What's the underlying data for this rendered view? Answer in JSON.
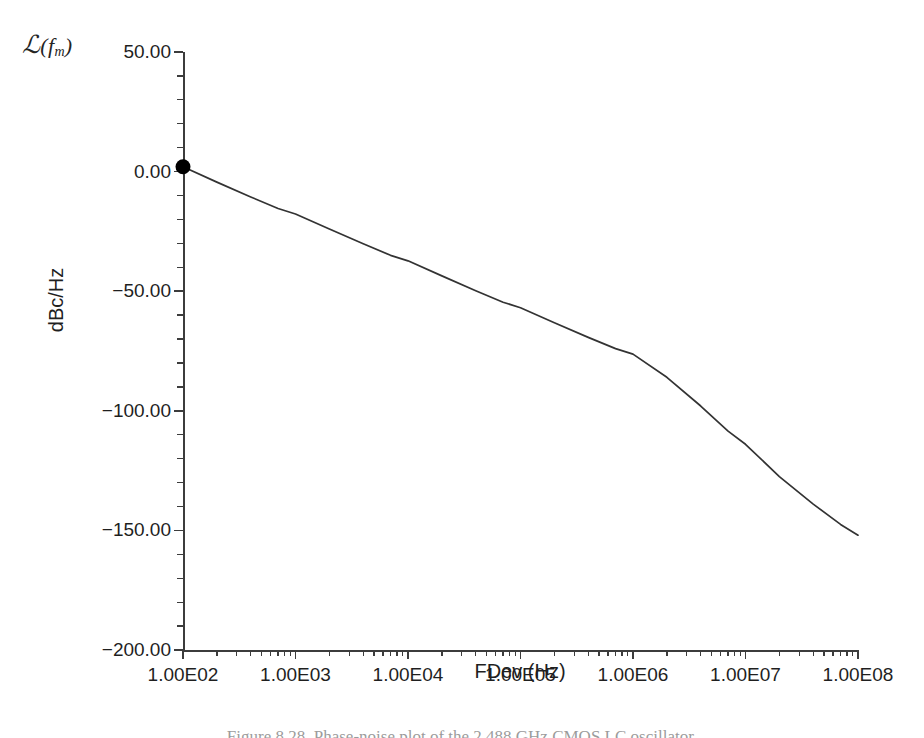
{
  "figure": {
    "corner_symbol": {
      "script_letter": "ℒ",
      "open_paren": "(",
      "variable": "f",
      "subscript": "m",
      "close_paren": ")"
    },
    "caption": "Figure 8.28. Phase-noise plot of the 2.488 GHz CMOS LC oscillator.",
    "line_color": "#333333",
    "axis_color": "#3c3c3c",
    "background_color": "#ffffff",
    "marker_color": "#000000"
  },
  "chart_data": {
    "type": "line",
    "title": "",
    "subtitle": "",
    "xlabel": "FDev (Hz)",
    "ylabel": "dBc/Hz",
    "xscale": "log",
    "yscale": "linear",
    "xlim": [
      100,
      100000000
    ],
    "ylim": [
      -200,
      50
    ],
    "grid": false,
    "legend": null,
    "x_tick_labels": [
      "1.00E02",
      "1.00E03",
      "1.00E04",
      "1.00E05",
      "1.00E06",
      "1.00E07",
      "1.00E08"
    ],
    "x_tick_values": [
      100,
      1000,
      10000,
      100000,
      1000000,
      10000000,
      100000000
    ],
    "y_tick_labels": [
      "50.00",
      "0.00",
      "-50.00",
      "-100.00",
      "-150.00",
      "-200.00"
    ],
    "y_tick_values": [
      50,
      0,
      -50,
      -100,
      -150,
      -200
    ],
    "y_minor_tick_count_between_majors": 4,
    "x_minor_ticks_per_decade": [
      2,
      3,
      4,
      5,
      6,
      7,
      8,
      9
    ],
    "series": [
      {
        "name": "Phase noise",
        "marker_points": [
          {
            "x": 100,
            "y": 2.0,
            "marker": "filled-circle"
          }
        ],
        "x": [
          100,
          200,
          400,
          700,
          1000,
          2000,
          4000,
          7000,
          10000,
          20000,
          40000,
          70000,
          100000,
          200000,
          400000,
          700000,
          1000000,
          2000000,
          4000000,
          7000000,
          10000000,
          20000000,
          40000000,
          70000000,
          100000000
        ],
        "y": [
          2.0,
          -4.4,
          -10.6,
          -15.4,
          -17.7,
          -24.0,
          -30.2,
          -35.0,
          -37.3,
          -43.6,
          -49.8,
          -54.6,
          -56.9,
          -63.2,
          -69.3,
          -74.0,
          -76.3,
          -86.0,
          -98.0,
          -108.5,
          -114.0,
          -127.5,
          -139.0,
          -147.5,
          -152.0
        ]
      }
    ],
    "annotations": []
  }
}
